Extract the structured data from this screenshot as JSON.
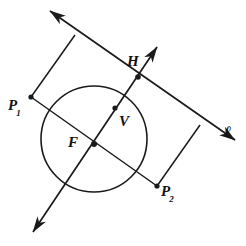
{
  "figure": {
    "stroke_color": "#1a1a1a",
    "background_color": "#ffffff",
    "labels": {
      "p1": {
        "text": "P",
        "subscript": "1"
      },
      "p2": {
        "text": "P",
        "subscript": "2"
      },
      "h": {
        "text": "H"
      },
      "v": {
        "text": "V"
      },
      "f": {
        "text": "F"
      },
      "line": {
        "text": "ℓ"
      }
    },
    "points": [
      {
        "name": "P1",
        "x": 31,
        "y": 97,
        "marked": true
      },
      {
        "name": "P2",
        "x": 157,
        "y": 186,
        "marked": true
      },
      {
        "name": "H",
        "x": 138,
        "y": 77,
        "marked": true
      },
      {
        "name": "V",
        "x": 115,
        "y": 108,
        "marked": true
      },
      {
        "name": "F",
        "x": 94,
        "y": 144,
        "marked": true
      }
    ],
    "circle": {
      "cx": 94,
      "cy": 139,
      "r": 53
    },
    "line_l": {
      "x1": 50,
      "y1": 11,
      "x2": 235,
      "y2": 140,
      "arrows": "both"
    },
    "axis_line": {
      "x1": 33,
      "y1": 232,
      "x2": 157,
      "y2": 47,
      "arrows": "both"
    },
    "segments": [
      {
        "name": "perp-P1",
        "x1": 75,
        "y1": 35,
        "x2": 31,
        "y2": 97
      },
      {
        "name": "perp-P2",
        "x1": 200,
        "y1": 125,
        "x2": 157,
        "y2": 186
      },
      {
        "name": "chord-P1-P2",
        "x1": 31,
        "y1": 97,
        "x2": 157,
        "y2": 186
      }
    ]
  }
}
